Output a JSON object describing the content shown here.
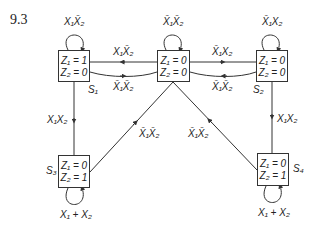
{
  "figure_number": "9.3",
  "states": [
    {
      "id": "S1",
      "label": "S₁",
      "z1": "Z₁ = 1",
      "z2": "Z₂ = 0",
      "self_loop": "X₁X̄₂"
    },
    {
      "id": "S0",
      "label": "",
      "z1": "Z₁ = 0",
      "z2": "Z₂ = 0",
      "self_loop": "X̄₁X̄₂"
    },
    {
      "id": "S2",
      "label": "S₂",
      "z1": "Z₁ = 0",
      "z2": "Z₂ = 0",
      "self_loop": "X̄₁X₂"
    },
    {
      "id": "S3",
      "label": "S₃",
      "z1": "Z₁ = 0",
      "z2": "Z₂ = 1",
      "self_loop": "X₁ + X₂"
    },
    {
      "id": "S4",
      "label": "S₄",
      "z1": "Z₁ = 0",
      "z2": "Z₂ = 1",
      "self_loop": "X₁ + X₂"
    }
  ],
  "transitions": [
    {
      "from": "S0",
      "to": "S1",
      "label": "X₁X̄₂"
    },
    {
      "from": "S1",
      "to": "S0",
      "label": "X̄₁X̄₂"
    },
    {
      "from": "S0",
      "to": "S2",
      "label": "X̄₁X₂"
    },
    {
      "from": "S2",
      "to": "S0",
      "label": "X̄₁X̄₂"
    },
    {
      "from": "S1",
      "to": "S3",
      "label": "X₁X₂"
    },
    {
      "from": "S2",
      "to": "S4",
      "label": "X₁X₂"
    },
    {
      "from": "S3",
      "to": "S0",
      "label": "X̄₁X̄₂"
    },
    {
      "from": "S4",
      "to": "S0",
      "label": "X̄₁X̄₂"
    }
  ]
}
